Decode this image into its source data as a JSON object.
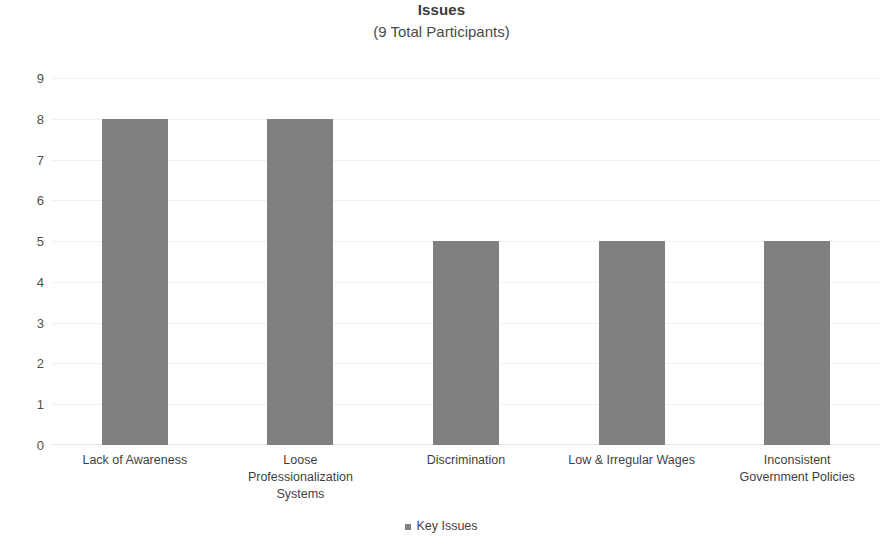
{
  "chart_data": {
    "type": "bar",
    "title": "Issues",
    "subtitle": "(9 Total Participants)",
    "categories": [
      "Lack of Awareness",
      "Loose Professionalization Systems",
      "Discrimination",
      "Low & Irregular Wages",
      "Inconsistent Government Policies"
    ],
    "category_lines": [
      [
        "Lack of Awareness"
      ],
      [
        "Loose",
        "Professionalization",
        "Systems"
      ],
      [
        "Discrimination"
      ],
      [
        "Low & Irregular Wages"
      ],
      [
        "Inconsistent",
        "Government Policies"
      ]
    ],
    "values": [
      8,
      8,
      5,
      5,
      5
    ],
    "series": [
      {
        "name": "Key Issues",
        "values": [
          8,
          8,
          5,
          5,
          5
        ]
      }
    ],
    "xlabel": "",
    "ylabel": "",
    "ylim": [
      0,
      9
    ],
    "y_ticks": [
      0,
      1,
      2,
      3,
      4,
      5,
      6,
      7,
      8,
      9
    ],
    "y_tick_labels": [
      "0",
      "1",
      "2",
      "3",
      "4",
      "5",
      "6",
      "7",
      "8",
      "9"
    ],
    "grid": true,
    "grid_axis": "y",
    "legend": {
      "position": "bottom",
      "entries": [
        {
          "label": "Key Issues",
          "color": "#808080",
          "marker": "square"
        }
      ]
    },
    "colors": {
      "bar": "#808080",
      "gridline": "#f1f1f1",
      "baseline": "#e6e6e6",
      "text": "#3f3f3f",
      "title": "#3a3a3a",
      "background": "#ffffff"
    }
  }
}
